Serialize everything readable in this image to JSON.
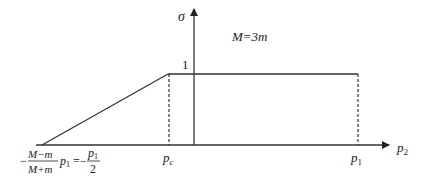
{
  "diagram": {
    "y_axis_label": "σ",
    "x_axis_label_base": "p",
    "x_axis_label_sub": "2",
    "annotation": "M=3m",
    "plateau_value_label": "1",
    "pc_label_base": "p",
    "pc_label_sub": "c",
    "p1_label_base": "p",
    "p1_label_sub": "1",
    "left_label": {
      "minus": "−",
      "frac_num": "M−m",
      "frac_den": "M+m",
      "p_base": "p",
      "p_sub": "1",
      "equals": "=−",
      "frac2_num_base": "p",
      "frac2_num_sub": "1",
      "frac2_den": "2"
    }
  }
}
